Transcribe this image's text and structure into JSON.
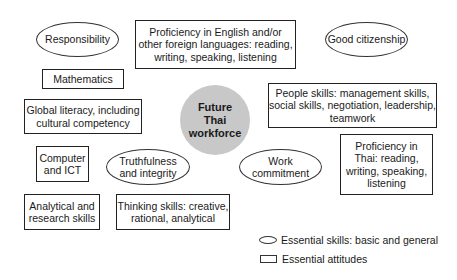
{
  "diagram": {
    "center": {
      "label": "Future\nThai\nworkforce",
      "fill": "#c8c8c8"
    },
    "skills_ellipses": [
      {
        "id": "responsibility",
        "label": "Responsibility"
      },
      {
        "id": "good-citizenship",
        "label": "Good citizenship"
      },
      {
        "id": "truthfulness",
        "label": "Truthfulness\nand integrity"
      },
      {
        "id": "work-commitment",
        "label": "Work\ncommitment"
      }
    ],
    "attitude_boxes": [
      {
        "id": "proficiency-english",
        "label": "Proficiency in English and/or\nother foreign languages: reading,\nwriting, speaking, listening"
      },
      {
        "id": "mathematics",
        "label": "Mathematics"
      },
      {
        "id": "global-literacy",
        "label": "Global literacy, including\ncultural competency"
      },
      {
        "id": "people-skills",
        "label": "People skills: management skills,\nsocial skills, negotiation, leadership,\nteamwork"
      },
      {
        "id": "computer-ict",
        "label": "Computer\nand ICT"
      },
      {
        "id": "proficiency-thai",
        "label": "Proficiency in\nThai: reading,\nwriting, speaking,\nlistening"
      },
      {
        "id": "analytical-research",
        "label": "Analytical and\nresearch skills"
      },
      {
        "id": "thinking-skills",
        "label": "Thinking skills: creative,\nrational, analytical"
      }
    ]
  },
  "legend": {
    "ellipse_label": "Essential skills: basic and general",
    "box_label": "Essential attitudes"
  }
}
